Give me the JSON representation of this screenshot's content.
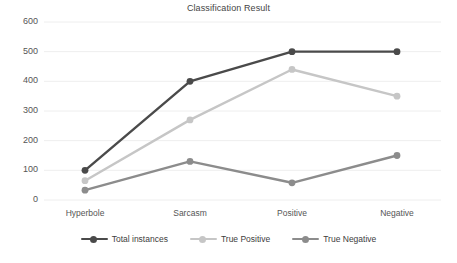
{
  "chart_data": {
    "type": "line",
    "title": "Classification Result",
    "xlabel": "",
    "ylabel": "",
    "categories": [
      "Hyperbole",
      "Sarcasm",
      "Positive",
      "Negative"
    ],
    "yticks": [
      0,
      100,
      200,
      300,
      400,
      500,
      600
    ],
    "ylim": [
      0,
      600
    ],
    "grid": true,
    "legend_position": "bottom",
    "series": [
      {
        "name": "Total instances",
        "color": "#4a4a4a",
        "values": [
          100,
          400,
          500,
          500
        ]
      },
      {
        "name": "True Positive",
        "color": "#c6c6c6",
        "values": [
          65,
          270,
          440,
          350
        ]
      },
      {
        "name": "True Negative",
        "color": "#8c8c8c",
        "values": [
          33,
          130,
          58,
          150
        ]
      }
    ]
  },
  "axis": {
    "y_labels": [
      "600",
      "500",
      "400",
      "300",
      "200",
      "100",
      "0"
    ],
    "x_labels": [
      "Hyperbole",
      "Sarcasm",
      "Positive",
      "Negative"
    ]
  },
  "legend": {
    "items": [
      {
        "label": "Total instances"
      },
      {
        "label": "True Positive"
      },
      {
        "label": "True Negative"
      }
    ]
  },
  "style": {
    "background": "#ffffff",
    "gridline_color": "#eeeeee",
    "text_color": "#555555",
    "title_color": "#444444"
  }
}
